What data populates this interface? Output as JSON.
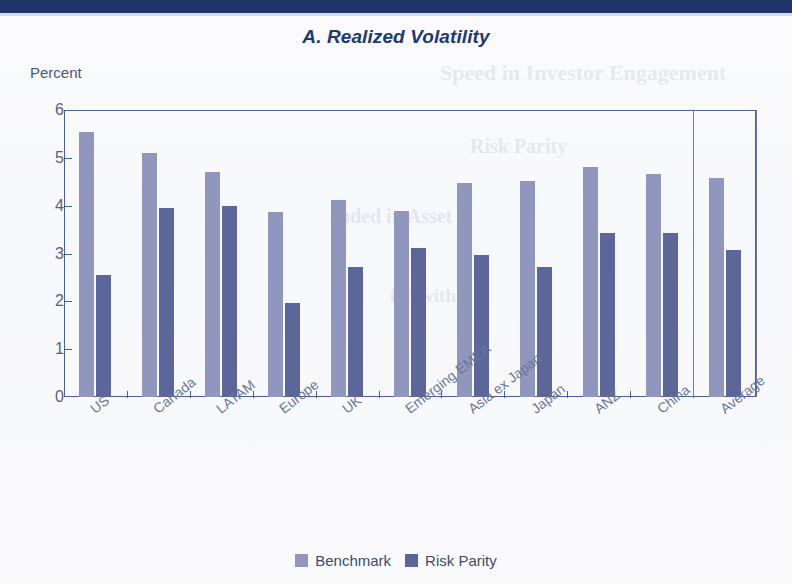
{
  "banner": {
    "color": "#1f3468"
  },
  "title": "A. Realized Volatility",
  "y_axis_label": "Percent",
  "legend": {
    "benchmark_label": "Benchmark",
    "risk_parity_label": "Risk Parity",
    "benchmark_color": "#9196bd",
    "risk_parity_color": "#5d6699"
  },
  "bleed_text": [
    "Speed in Investor Engagement",
    "Risk Parity",
    "ended in Asset",
    "ion with"
  ],
  "chart_data": {
    "type": "bar",
    "title": "A. Realized Volatility",
    "xlabel": "",
    "ylabel": "Percent",
    "ylim": [
      0,
      6
    ],
    "yticks": [
      0,
      1,
      2,
      3,
      4,
      5,
      6
    ],
    "grid": false,
    "legend_position": "bottom-center",
    "categories": [
      "US",
      "Canada",
      "LATAM",
      "Europe",
      "UK",
      "Emerging EMEA",
      "Asia ex Japan",
      "Japan",
      "ANZ",
      "China",
      "Average"
    ],
    "series": [
      {
        "name": "Benchmark",
        "color": "#9196bd",
        "values": [
          5.55,
          5.1,
          4.7,
          3.87,
          4.12,
          3.88,
          4.47,
          4.52,
          4.8,
          4.67,
          4.57
        ]
      },
      {
        "name": "Risk Parity",
        "color": "#5d6699",
        "values": [
          2.55,
          3.95,
          4.0,
          1.97,
          2.72,
          3.12,
          2.97,
          2.72,
          3.42,
          3.42,
          3.08
        ]
      }
    ],
    "highlight_category": "Average",
    "annotations": []
  }
}
